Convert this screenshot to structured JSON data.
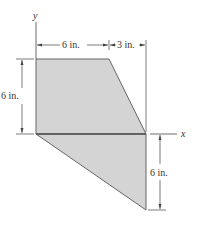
{
  "diagram": {
    "axes": {
      "x_label": "x",
      "y_label": "y"
    },
    "dimensions": {
      "top_left": "6 in.",
      "top_right": "3 in.",
      "left_height": "6 in.",
      "right_height": "6 in."
    },
    "colors": {
      "fill": "#d4d4d4",
      "edge": "#555555",
      "line": "#444444"
    }
  }
}
